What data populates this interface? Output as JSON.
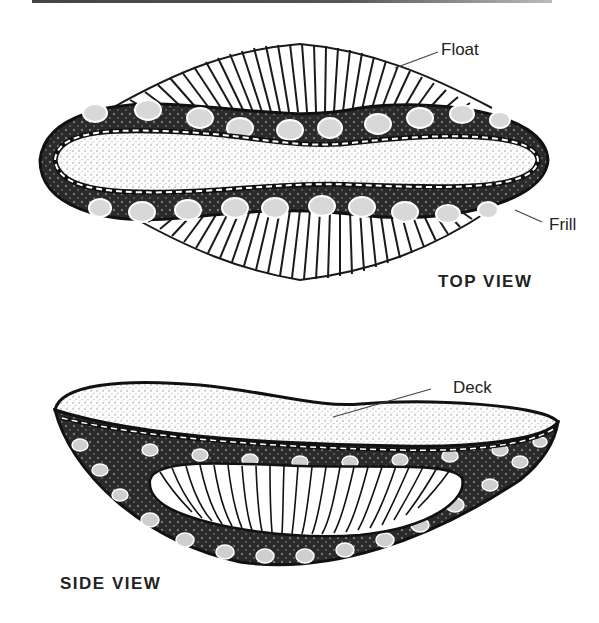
{
  "figure": {
    "top_view": {
      "caption": "TOP VIEW",
      "labels": {
        "float": "Float",
        "frill": "Frill"
      }
    },
    "side_view": {
      "caption": "SIDE VIEW",
      "labels": {
        "deck": "Deck"
      }
    }
  },
  "colors": {
    "ink": "#1a1a1a",
    "paper": "#ffffff",
    "stipple": "#9a9a9a"
  }
}
